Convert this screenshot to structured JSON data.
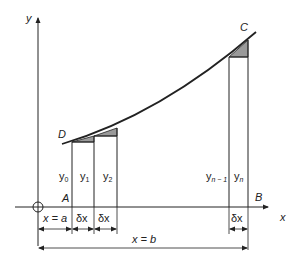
{
  "diagram": {
    "axes": {
      "y_label": "y",
      "x_label": "x"
    },
    "points": {
      "D": "D",
      "C": "C",
      "A": "A",
      "B": "B"
    },
    "ordinates": [
      {
        "base": "y",
        "sub": "0"
      },
      {
        "base": "y",
        "sub": "1"
      },
      {
        "base": "y",
        "sub": "2"
      },
      {
        "base": "y",
        "sub": "n − 1"
      },
      {
        "base": "y",
        "sub": "n"
      }
    ],
    "dimensions": {
      "x_eq_a": "x = a",
      "dx1": "δx",
      "dx2": "δx",
      "dx_last": "δx",
      "x_eq_b": "x = b"
    },
    "colors": {
      "line": "#222222",
      "shade": "#9a9a9a"
    }
  }
}
